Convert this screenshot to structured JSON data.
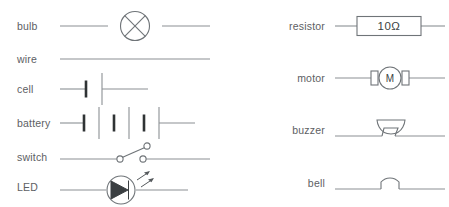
{
  "diagram": {
    "columns": [
      {
        "name": "left",
        "rows": [
          {
            "label": "bulb",
            "symbol": "bulb-symbol",
            "y": 26
          },
          {
            "label": "wire",
            "symbol": "wire-symbol",
            "y": 59
          },
          {
            "label": "cell",
            "symbol": "cell-symbol",
            "y": 89
          },
          {
            "label": "battery",
            "symbol": "battery-symbol",
            "y": 123
          },
          {
            "label": "switch",
            "symbol": "switch-symbol",
            "y": 157
          },
          {
            "label": "LED",
            "symbol": "led-symbol",
            "y": 187
          }
        ]
      },
      {
        "name": "right",
        "rows": [
          {
            "label": "resistor",
            "symbol": "resistor-symbol",
            "y": 26,
            "value": "10Ω"
          },
          {
            "label": "motor",
            "symbol": "motor-symbol",
            "y": 78,
            "value": "M"
          },
          {
            "label": "buzzer",
            "symbol": "buzzer-symbol",
            "y": 130
          },
          {
            "label": "bell",
            "symbol": "bell-symbol",
            "y": 183
          }
        ]
      }
    ]
  },
  "colors": {
    "background": "#ffffff",
    "label_text": "#5d6063",
    "wire": "#8b9094",
    "glyph_stroke": "#6f7478",
    "glyph_fill": "#3b3f42",
    "terminal_bar": "#2f3335"
  }
}
